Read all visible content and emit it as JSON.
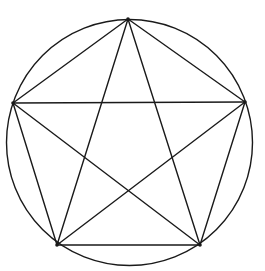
{
  "diagram": {
    "stroke_color": "#1a1a1a",
    "background": "#ffffff",
    "circle": {
      "cx": 129.5,
      "cy": 142.5,
      "r": 123
    },
    "vertices": [
      {
        "id": "top",
        "x": 128,
        "y": 19
      },
      {
        "id": "right",
        "x": 245,
        "y": 102
      },
      {
        "id": "bottom-right",
        "x": 200,
        "y": 245
      },
      {
        "id": "bottom-left",
        "x": 57,
        "y": 245
      },
      {
        "id": "left",
        "x": 13,
        "y": 103
      }
    ],
    "pentagon_edges": [
      [
        "top",
        "right"
      ],
      [
        "right",
        "bottom-right"
      ],
      [
        "bottom-right",
        "bottom-left"
      ],
      [
        "bottom-left",
        "left"
      ],
      [
        "left",
        "top"
      ]
    ],
    "pentagram_edges": [
      [
        "top",
        "bottom-right"
      ],
      [
        "top",
        "bottom-left"
      ],
      [
        "left",
        "right"
      ],
      [
        "left",
        "bottom-right"
      ],
      [
        "right",
        "bottom-left"
      ]
    ]
  }
}
